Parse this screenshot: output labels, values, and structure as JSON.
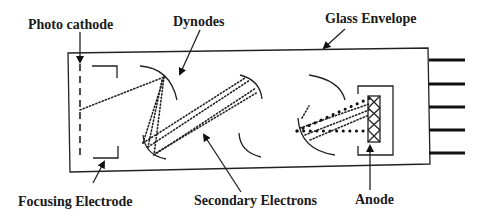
{
  "diagram": {
    "type": "photomultiplier-tube-schematic",
    "labels": {
      "photo_cathode": "Photo cathode",
      "dynodes": "Dynodes",
      "glass_envelope": "Glass Envelope",
      "focusing_electrode": "Focusing Electrode",
      "secondary_electrons": "Secondary Electrons",
      "anode": "Anode"
    },
    "components": [
      {
        "id": "photo-cathode",
        "label": "Photo cathode",
        "icon": "dashed-line"
      },
      {
        "id": "focusing-electrode",
        "label": "Focusing Electrode",
        "icon": "bracket"
      },
      {
        "id": "dynodes",
        "label": "Dynodes",
        "icon": "arc",
        "count": 4
      },
      {
        "id": "secondary-electrons",
        "label": "Secondary Electrons",
        "icon": "dotted-paths"
      },
      {
        "id": "anode",
        "label": "Anode",
        "icon": "cross-hatched-rectangle"
      },
      {
        "id": "glass-envelope",
        "label": "Glass Envelope",
        "icon": "outline-box"
      },
      {
        "id": "pins",
        "label": "",
        "icon": "connector-pins",
        "count": 5
      }
    ],
    "colors": {
      "stroke": "#222222",
      "background": "#ffffff",
      "text": "#1a1a1a"
    }
  }
}
